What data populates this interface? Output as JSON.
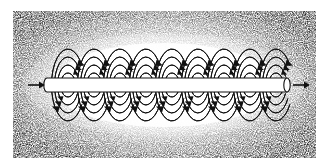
{
  "figure": {
    "type": "physics-diagram",
    "caption": "",
    "canvas": {
      "width": 329,
      "height": 168
    },
    "background": {
      "style": "stippled-halftone-scan",
      "plate_rect": {
        "x": 13,
        "y": 11,
        "width": 303,
        "height": 147
      },
      "page_color": "#ffffff",
      "stipple_color": "#555555",
      "vignette": "light-center-dark-edges"
    },
    "wire": {
      "label": "current-carrying-wire",
      "x_start": 47,
      "x_end": 287,
      "y_center": 85,
      "half_height": 7,
      "stroke_color": "#111111",
      "stroke_width": 1.1,
      "fill_color": "#ffffff",
      "end_cap": {
        "shape": "ellipse",
        "rx": 3.2,
        "ry": 7
      }
    },
    "current_arrows": [
      {
        "name": "current-arrow-left",
        "direction": "right",
        "tail_x": 28,
        "tip_x": 44,
        "y": 85
      },
      {
        "name": "current-arrow-right",
        "direction": "right",
        "tail_x": 293,
        "tip_x": 309,
        "y": 85
      }
    ],
    "field_lines": {
      "name": "magnetic-field-loops",
      "count": 9,
      "rings_per_group": 4,
      "y_center": 85,
      "first_center_x": 68,
      "spacing_x": 26,
      "ring_radii": [
        {
          "rx": 7.5,
          "ry": 12
        },
        {
          "rx": 10.5,
          "ry": 20
        },
        {
          "rx": 13.5,
          "ry": 28
        },
        {
          "rx": 16.5,
          "ry": 36
        }
      ],
      "stroke_color": "#111111",
      "stroke_width": 1.0,
      "open_side": "right",
      "arrowheads": {
        "top": "pointing-right",
        "bottom": "pointing-left",
        "fill_color": "#111111"
      }
    }
  }
}
